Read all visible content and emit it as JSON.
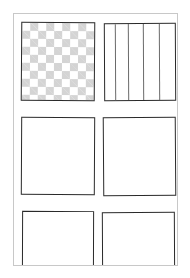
{
  "diagram": {
    "type": "wireframe-sketch",
    "layout": {
      "columns": 2,
      "rows_visible": 3
    },
    "colors": {
      "stroke": "#2a2a2a",
      "frame": "#c8c8c8",
      "checker_fill": "#d4d4d4",
      "stripe": "#6a6a6a",
      "background": "#ffffff"
    },
    "tiles": [
      {
        "id": "t1",
        "row": 1,
        "col": 1,
        "fill": "checkerboard"
      },
      {
        "id": "t2",
        "row": 1,
        "col": 2,
        "fill": "vertical-stripes",
        "stripe_count": 4
      },
      {
        "id": "t3",
        "row": 2,
        "col": 1,
        "fill": "empty"
      },
      {
        "id": "t4",
        "row": 2,
        "col": 2,
        "fill": "empty"
      },
      {
        "id": "t5",
        "row": 3,
        "col": 1,
        "fill": "empty",
        "clipped": true
      },
      {
        "id": "t6",
        "row": 3,
        "col": 2,
        "fill": "empty",
        "clipped": true
      }
    ]
  }
}
